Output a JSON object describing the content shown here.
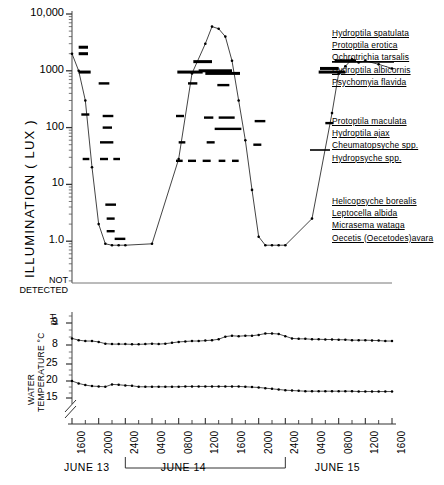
{
  "figure": {
    "title_illumination": "ILLUMINATION   ( LUX )",
    "title_water": "WATER",
    "title_temperature": "TEMPERATURE °C",
    "title_ph": "pH",
    "not_detected_line1": "NOT",
    "not_detected_line2": "DETECTED"
  },
  "chart_data": {
    "type": "line",
    "xlabel": "",
    "ylabel": "ILLUMINATION ( LUX )",
    "grid": false,
    "legend": "right",
    "x_tick_labels": [
      "1600",
      "2000",
      "2400",
      "0400",
      "0800",
      "1200",
      "1600",
      "2000",
      "2400",
      "0400",
      "0800",
      "1200",
      "1600"
    ],
    "x_hours": [
      16,
      20,
      24,
      28,
      32,
      36,
      40,
      44,
      48,
      52,
      56,
      60,
      64
    ],
    "day_labels": [
      "JUNE 13",
      "JUNE 14",
      "JUNE 15"
    ],
    "day_boundaries_hours": [
      24,
      48
    ],
    "panels": [
      {
        "name": "illumination",
        "scale": "log",
        "ylabel": "ILLUMINATION ( LUX )",
        "y_tick_labels": [
          "10,000",
          "1000",
          "100",
          "10",
          "1.0"
        ],
        "y_tick_values": [
          10000,
          1000,
          100,
          10,
          1
        ],
        "ylim": [
          1,
          10000
        ],
        "below_axis_label": "NOT DETECTED",
        "series": [
          {
            "name": "illumination",
            "units": "lux",
            "x": [
              16,
              17,
              18,
              19,
              20,
              21,
              22,
              23,
              24,
              28,
              32,
              34,
              36,
              37,
              38,
              39,
              40,
              41,
              42,
              43,
              44,
              45,
              46,
              47,
              48,
              52,
              55,
              56,
              57,
              58,
              59,
              60,
              62,
              64
            ],
            "y": [
              2000,
              1000,
              300,
              20,
              2.0,
              0.9,
              0.85,
              0.85,
              0.85,
              0.9,
              28,
              900,
              3000,
              6000,
              5500,
              4000,
              1500,
              300,
              60,
              8,
              1.2,
              0.85,
              0.85,
              0.85,
              0.85,
              2.5,
              180,
              900,
              1200,
              1600,
              1400,
              1500,
              1300,
              1100
            ]
          }
        ],
        "activity_bars": [
          {
            "group": 1,
            "label": "Hydroptila spatulata",
            "segments": [
              [
                17.0,
                18.4,
                2600
              ],
              [
                17.0,
                18.4,
                2000
              ],
              [
                34.2,
                37.0,
                1450
              ],
              [
                35.0,
                40.0,
                1000
              ],
              [
                53.2,
                56.0,
                1100
              ],
              [
                55.4,
                58.6,
                1500
              ]
            ]
          },
          {
            "group": 1,
            "label": "Protoptila erotica",
            "segments": [
              [
                17.0,
                18.8,
                950
              ],
              [
                31.8,
                35.6,
                950
              ],
              [
                36.0,
                41.2,
                900
              ],
              [
                53.0,
                57.0,
                950
              ]
            ]
          },
          {
            "group": 1,
            "label": "Ochrotrichia tarsalis",
            "segments": [
              [
                20.0,
                21.6,
                600
              ],
              [
                33.4,
                34.8,
                600
              ],
              [
                37.8,
                39.6,
                560
              ]
            ]
          },
          {
            "group": 2,
            "label": "Protoptila maculata",
            "segments": [
              [
                17.4,
                18.6,
                170
              ],
              [
                20.6,
                22.2,
                160
              ],
              [
                31.6,
                32.8,
                160
              ],
              [
                35.8,
                37.2,
                150
              ],
              [
                38.0,
                40.4,
                150
              ],
              [
                43.4,
                45.0,
                130
              ],
              [
                54.0,
                55.2,
                120
              ]
            ]
          },
          {
            "group": 2,
            "label": "Hydroptila ajax",
            "segments": [
              [
                20.6,
                22.0,
                100
              ],
              [
                37.4,
                41.4,
                95
              ]
            ]
          },
          {
            "group": 2,
            "label": "Cheumatopsyche spp.",
            "segments": [
              [
                20.2,
                22.2,
                55
              ],
              [
                32.0,
                33.0,
                55
              ],
              [
                36.2,
                37.4,
                55
              ],
              [
                43.2,
                44.4,
                50
              ]
            ]
          },
          {
            "group": 2,
            "label": "Hydropsyche spp.",
            "segments": [
              [
                17.6,
                18.6,
                28
              ],
              [
                20.2,
                21.4,
                28
              ],
              [
                22.2,
                23.2,
                28
              ],
              [
                31.6,
                32.6,
                26
              ],
              [
                33.4,
                34.6,
                26
              ],
              [
                35.6,
                36.8,
                26
              ],
              [
                38.0,
                39.0,
                26
              ],
              [
                40.0,
                41.0,
                26
              ]
            ]
          },
          {
            "group": 3,
            "label": "Helicopsyche borealis",
            "segments": [
              [
                21.0,
                22.6,
                4.4
              ]
            ]
          },
          {
            "group": 3,
            "label": "Leptocella albida",
            "segments": [
              [
                21.2,
                22.4,
                2.5
              ]
            ]
          },
          {
            "group": 3,
            "label": "Micrasema wataga",
            "segments": [
              [
                21.2,
                22.4,
                1.5
              ]
            ]
          },
          {
            "group": 3,
            "label": "Oecetis (Oecetodes) avara",
            "segments": [
              [
                22.4,
                24.0,
                1.1
              ]
            ]
          }
        ]
      },
      {
        "name": "ph",
        "ylabel": "pH",
        "y_tick_labels": [
          "9",
          "8"
        ],
        "y_tick_values": [
          9,
          8
        ],
        "ylim": [
          7.6,
          9.3
        ],
        "series": [
          {
            "name": "pH",
            "x": [
              16,
              17,
              18,
              19,
              20,
              21,
              22,
              23,
              24,
              25,
              26,
              27,
              28,
              29,
              30,
              31,
              32,
              33,
              34,
              35,
              36,
              37,
              38,
              39,
              40,
              41,
              42,
              43,
              44,
              45,
              46,
              47,
              48,
              49,
              50,
              51,
              52,
              53,
              54,
              55,
              56,
              57,
              58,
              59,
              60,
              61,
              62,
              63,
              64
            ],
            "y": [
              8.3,
              8.22,
              8.18,
              8.18,
              8.14,
              8.06,
              8.04,
              8.04,
              8.04,
              8.03,
              8.03,
              8.04,
              8.06,
              8.04,
              8.06,
              8.1,
              8.14,
              8.16,
              8.18,
              8.18,
              8.2,
              8.22,
              8.26,
              8.38,
              8.42,
              8.4,
              8.42,
              8.42,
              8.46,
              8.52,
              8.52,
              8.5,
              8.4,
              8.3,
              8.28,
              8.28,
              8.26,
              8.26,
              8.25,
              8.25,
              8.24,
              8.24,
              8.22,
              8.22,
              8.22,
              8.21,
              8.2,
              8.18,
              8.18
            ]
          }
        ]
      },
      {
        "name": "water_temperature",
        "ylabel": "WATER TEMPERATURE °C",
        "y_tick_labels": [
          "25",
          "20",
          "15"
        ],
        "y_tick_values": [
          25,
          20,
          15
        ],
        "ylim": [
          14.5,
          26
        ],
        "axis_break": true,
        "series": [
          {
            "name": "water temperature",
            "units": "°C",
            "x": [
              16,
              17,
              18,
              19,
              20,
              21,
              22,
              23,
              24,
              25,
              26,
              27,
              28,
              29,
              30,
              31,
              32,
              33,
              34,
              35,
              36,
              37,
              38,
              39,
              40,
              41,
              42,
              43,
              44,
              45,
              46,
              47,
              48,
              49,
              50,
              51,
              52,
              53,
              54,
              55,
              56,
              57,
              58,
              59,
              60,
              61,
              62,
              63,
              64
            ],
            "y": [
              20.0,
              19.3,
              18.8,
              18.5,
              18.4,
              18.3,
              19.0,
              18.9,
              18.7,
              18.6,
              18.3,
              18.3,
              18.3,
              18.3,
              18.3,
              18.3,
              18.3,
              18.4,
              18.4,
              18.4,
              18.4,
              18.4,
              18.4,
              18.4,
              18.4,
              18.4,
              18.3,
              18.2,
              18.1,
              17.9,
              17.7,
              17.5,
              17.3,
              17.2,
              17.1,
              17.0,
              17.0,
              17.0,
              17.0,
              17.0,
              17.0,
              17.0,
              17.0,
              16.9,
              16.9,
              16.9,
              16.9,
              16.9,
              16.9
            ]
          }
        ]
      }
    ],
    "legend_groups": [
      {
        "id": 1,
        "items": [
          "Hydroptila spatulata",
          "Protoptila erotica",
          "Ochrotrichia  tarsalis",
          "Hydroptila  albicornis",
          "Psychomyia  flavida"
        ]
      },
      {
        "id": 2,
        "items": [
          "Protoptila  maculata",
          "Hydroptila ajax",
          "Cheumatopsyche spp.",
          "Hydropsyche spp."
        ]
      },
      {
        "id": 3,
        "items": [
          "Helicopsyche borealis",
          "Leptocella albida",
          "Micrasema wataga",
          "Oecetis (Oecetodes)avara"
        ]
      }
    ]
  }
}
